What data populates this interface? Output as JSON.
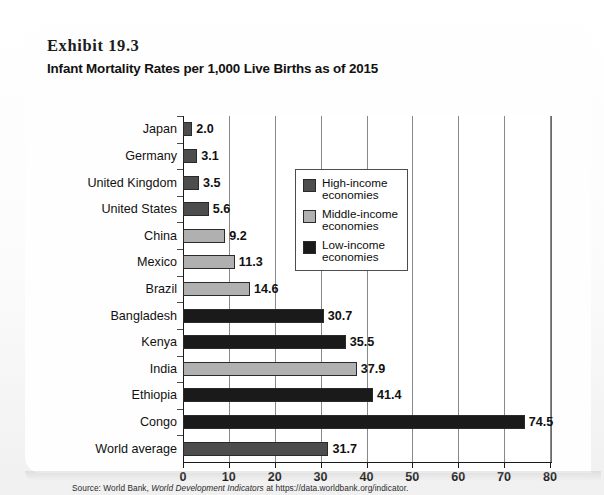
{
  "exhibit": {
    "number": "Exhibit 19.3",
    "title": "Infant Mortality Rates per 1,000 Live Births as of 2015"
  },
  "source": {
    "prefix": "Source: World Bank, ",
    "italic": "World Development Indicators",
    "suffix": " at https://data.worldbank.org/indicator."
  },
  "legend": {
    "items": [
      {
        "label": "High-income\neconomies",
        "color": "#4d4d4d",
        "key": "high"
      },
      {
        "label": "Middle-income\neconomies",
        "color": "#b0b0b0",
        "key": "middle"
      },
      {
        "label": "Low-income\neconomies",
        "color": "#1a1a1a",
        "key": "low"
      }
    ]
  },
  "colors": {
    "high_income": "#4d4d4d",
    "middle_income": "#b0b0b0",
    "low_income": "#1a1a1a",
    "axis": "#1a1a1a",
    "grid": "#888888"
  },
  "chart_data": {
    "type": "bar",
    "orientation": "horizontal",
    "title": "Infant Mortality Rates per 1,000 Live Births as of 2015",
    "xlabel": "",
    "ylabel": "",
    "xlim": [
      0,
      80
    ],
    "xticks": [
      0,
      10,
      20,
      30,
      40,
      50,
      60,
      70,
      80
    ],
    "xtick_labels": [
      "0",
      "10",
      "20",
      "30",
      "40",
      "50",
      "60",
      "70",
      "80"
    ],
    "grid": true,
    "legend_position": "upper-right-inside",
    "categories": [
      "Japan",
      "Germany",
      "United Kingdom",
      "United States",
      "China",
      "Mexico",
      "Brazil",
      "Bangladesh",
      "Kenya",
      "India",
      "Ethiopia",
      "Congo",
      "World average"
    ],
    "values": [
      2.0,
      3.1,
      3.5,
      5.6,
      9.2,
      11.3,
      14.6,
      30.7,
      35.5,
      37.9,
      41.4,
      74.5,
      31.7
    ],
    "value_labels": [
      "2.0",
      "3.1",
      "3.5",
      "5.6",
      "9.2",
      "11.3",
      "14.6",
      "30.7",
      "35.5",
      "37.9",
      "41.4",
      "74.5",
      "31.7"
    ],
    "groups": [
      "high",
      "high",
      "high",
      "high",
      "middle",
      "middle",
      "middle",
      "low",
      "low",
      "middle",
      "low",
      "low",
      "high"
    ],
    "group_names": {
      "high": "High-income economies",
      "middle": "Middle-income economies",
      "low": "Low-income economies"
    }
  }
}
